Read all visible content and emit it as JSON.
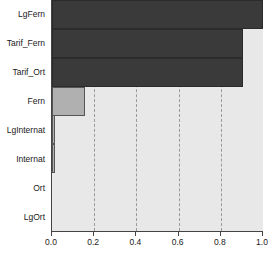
{
  "chart_data": {
    "type": "bar",
    "orientation": "horizontal",
    "title": "",
    "subtitle": "",
    "xlabel": "",
    "ylabel": "",
    "xlim": [
      0.0,
      1.0
    ],
    "grid": true,
    "legend": "none",
    "categories": [
      "LgOrt",
      "Ort",
      "Internat",
      "LgInternat",
      "Fern",
      "Tarif_Ort",
      "Tarif_Fern",
      "LgFern"
    ],
    "values": [
      0.0,
      0.0,
      0.015,
      0.015,
      0.155,
      0.905,
      0.905,
      1.0
    ],
    "tick_labels": [
      "0.0",
      "0.2",
      "0.4",
      "0.6",
      "0.8",
      "1.0"
    ],
    "tick_values": [
      0.0,
      0.2,
      0.4,
      0.6,
      0.8,
      1.0
    ],
    "gridline_values": [
      0.2,
      0.4,
      0.6,
      0.8
    ],
    "bar_styles": [
      "dark",
      "dark",
      "light",
      "light",
      "light",
      "light",
      "light",
      "light"
    ],
    "colors": {
      "bar_dark": "#3a3a3a",
      "bar_dark_border": "#2b2b2b",
      "bar_light": "#b0b0b0",
      "bar_light_border": "#555555",
      "plot_background": "#e8e8e8",
      "axis": "#444444",
      "gridline": "#9a9a9a",
      "text": "#1a1a1a",
      "page_background": "#ffffff"
    }
  }
}
